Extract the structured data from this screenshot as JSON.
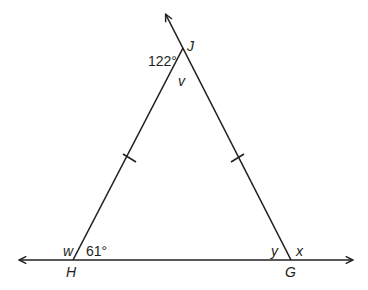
{
  "diagram": {
    "type": "geometry-triangle",
    "stroke_color": "#231f20",
    "vertices": {
      "J": {
        "label": "J"
      },
      "H": {
        "label": "H"
      },
      "G": {
        "label": "G"
      }
    },
    "angles": {
      "exterior_J": "122°",
      "interior_J": "v",
      "interior_H": "61°",
      "exterior_H": "w",
      "interior_G": "y",
      "exterior_G": "x"
    },
    "congruent_sides": [
      "HJ",
      "JG"
    ]
  }
}
